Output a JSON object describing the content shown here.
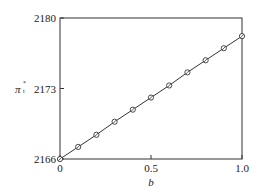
{
  "chart_data": {
    "type": "line",
    "title": "",
    "xlabel": "b",
    "ylabel": "π_t^*",
    "ylabel_symbol": "π",
    "ylabel_sub": "t",
    "ylabel_sup": "*",
    "xlim": [
      0,
      1.0
    ],
    "ylim": [
      2166,
      2180
    ],
    "grid": false,
    "legend": null,
    "x_ticks": [
      0,
      0.5,
      1.0
    ],
    "x_tick_labels": [
      "0",
      "0.5",
      "1.0"
    ],
    "y_ticks": [
      2166,
      2173,
      2180
    ],
    "y_tick_labels": [
      "2166",
      "2173",
      "2180"
    ],
    "series": [
      {
        "name": "π_t^*",
        "marker": "circle-open-slashed",
        "x": [
          0,
          0.1,
          0.2,
          0.3,
          0.4,
          0.5,
          0.6,
          0.7,
          0.8,
          0.9,
          1.0
        ],
        "values": [
          2166.0,
          2167.2,
          2168.4,
          2169.7,
          2170.9,
          2172.1,
          2173.3,
          2174.6,
          2175.8,
          2177.0,
          2178.2
        ]
      }
    ]
  },
  "colors": {
    "line": "#333333",
    "axes": "#333333",
    "background": "#ffffff"
  }
}
